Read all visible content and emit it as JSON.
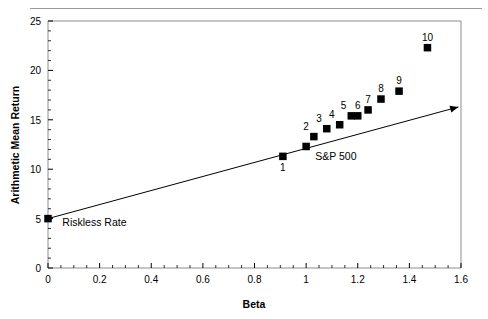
{
  "chart_data": {
    "type": "scatter",
    "title": "",
    "xlabel": "Beta",
    "ylabel": "Arithmetic Mean Return",
    "xlim": [
      0,
      1.6
    ],
    "ylim": [
      0,
      25
    ],
    "xticks": [
      0,
      0.2,
      0.4,
      0.6,
      0.8,
      1,
      1.2,
      1.4,
      1.6
    ],
    "xticklabels": [
      "0",
      "0.2",
      "0.4",
      "0.6",
      "0.8",
      "1",
      "1.2",
      "1.4",
      "1.6"
    ],
    "yticks": [
      0,
      5,
      10,
      15,
      20,
      25
    ],
    "yticklabels": [
      "0",
      "5",
      "10",
      "15",
      "20",
      "25"
    ],
    "x_minor_tick_step": 0.05,
    "y_minor_tick_step": 1,
    "grid": false,
    "legend": "none",
    "points": [
      {
        "label": "Riskless Rate",
        "x": 0.0,
        "y": 5.0,
        "label_pos": "right"
      },
      {
        "label": "1",
        "x": 0.91,
        "y": 11.3,
        "label_pos": "below"
      },
      {
        "label": "S&P 500",
        "x": 1.0,
        "y": 12.3,
        "label_pos": "below-right"
      },
      {
        "label": "2",
        "x": 1.03,
        "y": 13.3,
        "label_pos": "above-left"
      },
      {
        "label": "3",
        "x": 1.08,
        "y": 14.1,
        "label_pos": "above-left"
      },
      {
        "label": "4",
        "x": 1.13,
        "y": 14.5,
        "label_pos": "above-left"
      },
      {
        "label": "5",
        "x": 1.175,
        "y": 15.4,
        "label_pos": "above-left"
      },
      {
        "label": "6",
        "x": 1.2,
        "y": 15.4,
        "label_pos": "above"
      },
      {
        "label": "7",
        "x": 1.24,
        "y": 16.0,
        "label_pos": "above"
      },
      {
        "label": "8",
        "x": 1.29,
        "y": 17.1,
        "label_pos": "above"
      },
      {
        "label": "9",
        "x": 1.36,
        "y": 17.9,
        "label_pos": "above"
      },
      {
        "label": "10",
        "x": 1.47,
        "y": 22.3,
        "label_pos": "above"
      }
    ],
    "line": {
      "name": "Security Market Line",
      "x_start": 0.0,
      "y_start": 5.0,
      "x_end": 1.59,
      "y_end": 16.3,
      "arrow_at_end": true
    },
    "annotations": [
      {
        "text": "Riskless Rate",
        "x": 0.04,
        "y": 4.3
      },
      {
        "text": "S&P 500",
        "x": 1.02,
        "y": 10.9
      }
    ]
  }
}
